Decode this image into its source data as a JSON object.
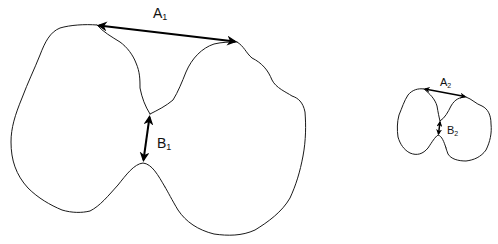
{
  "diagram": {
    "large_shape": {
      "label_a": "A",
      "label_a_sub": "1",
      "label_b": "B",
      "label_b_sub": "1"
    },
    "small_shape": {
      "label_a": "A",
      "label_a_sub": "2",
      "label_b": "B",
      "label_b_sub": "2"
    },
    "colors": {
      "stroke": "#1a1a1a",
      "background": "#ffffff"
    }
  }
}
